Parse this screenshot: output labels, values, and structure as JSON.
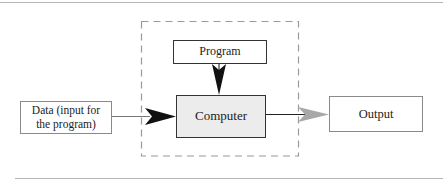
{
  "diagram": {
    "nodes": {
      "program": {
        "label": "Program"
      },
      "computer": {
        "label": "Computer"
      },
      "data": {
        "label": "Data (input for the program)"
      },
      "output": {
        "label": "Output"
      }
    },
    "edges": [
      {
        "from": "data",
        "to": "computer",
        "style": "black-arrow"
      },
      {
        "from": "program",
        "to": "computer",
        "style": "black-arrow"
      },
      {
        "from": "computer",
        "to": "output",
        "style": "gray-arrow"
      }
    ],
    "group": {
      "name": "computer-system-boundary",
      "style": "dashed",
      "contains": [
        "program",
        "computer"
      ]
    }
  },
  "colors": {
    "box_border_light": "#8a8a8a",
    "box_border_dark": "#333333",
    "computer_fill": "#ececec",
    "dashed_border": "#9a9a9a",
    "black_arrow": "#111111",
    "gray_arrow": "#a8a8a8",
    "rule": "#b4b4b4"
  }
}
